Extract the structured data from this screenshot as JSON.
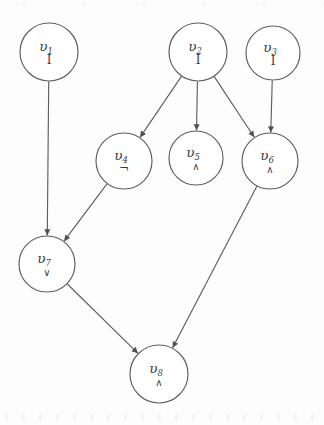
{
  "figure": {
    "type": "directed-acyclic-graph",
    "background_color": "#fdfdfd",
    "stroke_color": "#5d5f62",
    "text_color": "#3b3d40",
    "width": 324,
    "height": 425
  },
  "nodes": [
    {
      "id": "v1",
      "var": "υ",
      "subscript": "1",
      "op": "I",
      "cx": 49,
      "cy": 52,
      "r": 29,
      "op_size": "normal"
    },
    {
      "id": "v2",
      "var": "υ",
      "subscript": "2",
      "op": "I",
      "cx": 198,
      "cy": 52,
      "r": 29,
      "op_size": "normal"
    },
    {
      "id": "v3",
      "var": "υ",
      "subscript": "3",
      "op": "I",
      "cx": 273,
      "cy": 53,
      "r": 27,
      "op_size": "normal"
    },
    {
      "id": "v4",
      "var": "υ",
      "subscript": "4",
      "op": "¬",
      "cx": 124,
      "cy": 161,
      "r": 28,
      "op_size": "normal"
    },
    {
      "id": "v5",
      "var": "υ",
      "subscript": "5",
      "op": "∧",
      "cx": 196,
      "cy": 158,
      "r": 27,
      "op_size": "small"
    },
    {
      "id": "v6",
      "var": "υ",
      "subscript": "6",
      "op": "∧",
      "cx": 270,
      "cy": 161,
      "r": 28,
      "op_size": "small"
    },
    {
      "id": "v7",
      "var": "υ",
      "subscript": "7",
      "op": "∨",
      "cx": 47,
      "cy": 264,
      "r": 28,
      "op_size": "small"
    },
    {
      "id": "v8",
      "var": "υ",
      "subscript": "8",
      "op": "∧",
      "cx": 159,
      "cy": 374,
      "r": 29,
      "op_size": "small"
    }
  ],
  "edges": [
    {
      "from": "v1",
      "to": "v7",
      "label": ""
    },
    {
      "from": "v2",
      "to": "v4",
      "label": ""
    },
    {
      "from": "v2",
      "to": "v5",
      "label": ""
    },
    {
      "from": "v2",
      "to": "v6",
      "label": ""
    },
    {
      "from": "v3",
      "to": "v6",
      "label": ""
    },
    {
      "from": "v4",
      "to": "v7",
      "label": ""
    },
    {
      "from": "v6",
      "to": "v8",
      "label": ""
    },
    {
      "from": "v7",
      "to": "v8",
      "label": ""
    }
  ]
}
